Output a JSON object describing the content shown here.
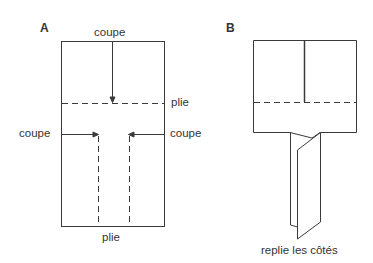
{
  "panels": {
    "a": {
      "letter": "A",
      "labels": {
        "top_cut": "coupe",
        "fold_right": "plie",
        "left_cut": "coupe",
        "right_cut": "coupe",
        "bottom_fold": "plie"
      }
    },
    "b": {
      "letter": "B",
      "labels": {
        "caption": "replie les côtés"
      }
    }
  },
  "colors": {
    "line": "#3a3a3a",
    "text": "#333333",
    "background": "#ffffff"
  }
}
